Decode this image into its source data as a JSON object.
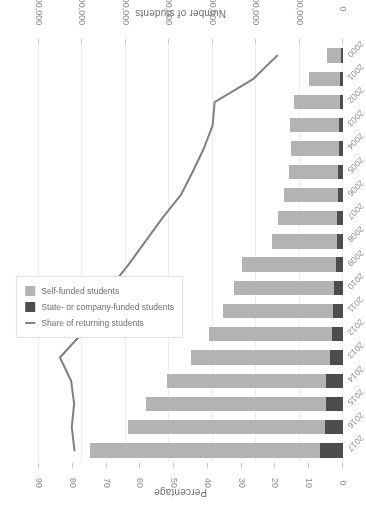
{
  "chart_data": {
    "type": "bar",
    "title": "",
    "subtitle": "",
    "orientation": "horizontal-stacked-with-line",
    "rotation_degrees": 180,
    "categories": [
      "2000",
      "2001",
      "2002",
      "2003",
      "2004",
      "2005",
      "2006",
      "2007",
      "2008",
      "2009",
      "2010",
      "2011",
      "2012",
      "2013",
      "2014",
      "2015",
      "2016",
      "2017"
    ],
    "xlabel": "",
    "ylabel": "Number of students",
    "secondary_ylabel": "Percentage",
    "ylim": [
      0,
      700000
    ],
    "y_ticks": [
      0,
      100000,
      200000,
      300000,
      400000,
      500000,
      600000,
      700000
    ],
    "y_tick_labels": [
      "0",
      "100,000",
      "200,000",
      "300,000",
      "400,000",
      "500,000",
      "600,000",
      "700,000"
    ],
    "secondary_ylim": [
      0,
      90
    ],
    "secondary_ticks": [
      0,
      10,
      20,
      30,
      40,
      50,
      60,
      70,
      80,
      90
    ],
    "secondary_tick_labels": [
      "0",
      "10",
      "20",
      "30",
      "40",
      "50",
      "60",
      "70",
      "80",
      "90"
    ],
    "grid": true,
    "legend_position": "middle-left",
    "series": [
      {
        "name": "Self-funded students",
        "type": "bar",
        "color": "#b3b3b3",
        "axis": "primary",
        "values": [
          33000,
          70000,
          105000,
          114000,
          110000,
          113000,
          123000,
          137000,
          150000,
          215000,
          232000,
          254000,
          283000,
          320000,
          367000,
          414000,
          452000,
          528000
        ]
      },
      {
        "name": "State- or company-funded students",
        "type": "bar",
        "color": "#4d4d4d",
        "axis": "primary",
        "values": [
          5000,
          8000,
          8000,
          9000,
          10000,
          11000,
          12000,
          13000,
          14000,
          17000,
          20000,
          23000,
          26000,
          31000,
          38000,
          40000,
          42000,
          54000
        ]
      },
      {
        "name": "Share of returning students",
        "type": "line",
        "color": "#808080",
        "axis": "secondary",
        "values": [
          19.5,
          26.5,
          38.0,
          38.6,
          41.2,
          44.5,
          48.0,
          53.5,
          58.5,
          63.5,
          69.0,
          74.0,
          77.5,
          83.8,
          80.5,
          79.6,
          80.3,
          79.5
        ]
      }
    ]
  },
  "axes": {
    "percentage_title": "Percentage",
    "students_title": "Number of students"
  },
  "legend": {
    "items": [
      {
        "label": "Self-funded students",
        "marker": "square",
        "color": "#b3b3b3"
      },
      {
        "label": "State- or company-funded students",
        "marker": "square",
        "color": "#4d4d4d"
      },
      {
        "label": "Share of returning students",
        "marker": "line",
        "color": "#808080"
      }
    ]
  }
}
